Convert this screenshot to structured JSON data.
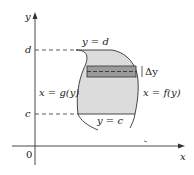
{
  "diagram": {
    "axes": {
      "x_label": "x",
      "y_label": "y",
      "origin_label": "0"
    },
    "levels": {
      "top": "d",
      "bottom": "c"
    },
    "curve_labels": {
      "top": "y = d",
      "bottom": "y = c",
      "left": "x = g(y)",
      "right": "x = f(y)"
    },
    "strip": {
      "label": "Δy"
    },
    "colors": {
      "region_fill": "#dcdcdc",
      "strip_fill": "#9a9a9a",
      "outline": "#333333",
      "axis": "#333333"
    }
  }
}
